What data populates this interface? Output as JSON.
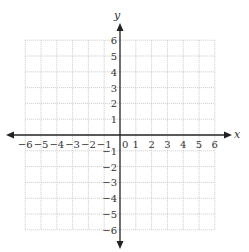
{
  "diagram": {
    "type": "coordinate-plane",
    "x_axis_label": "x",
    "y_axis_label": "y",
    "x_range": [
      -6,
      6
    ],
    "y_range": [
      -6,
      6
    ],
    "grid_step": 1,
    "origin_label": "0",
    "x_ticks": [
      "-6",
      "-5",
      "-4",
      "-3",
      "-2",
      "-1",
      "1",
      "2",
      "3",
      "4",
      "5",
      "6"
    ],
    "y_ticks": [
      "6",
      "5",
      "4",
      "3",
      "2",
      "1",
      "-1",
      "-2",
      "-3",
      "-4",
      "-5",
      "-6"
    ],
    "colors": {
      "grid": "#bdbdbd",
      "axis": "#222222",
      "text": "#333333"
    }
  }
}
